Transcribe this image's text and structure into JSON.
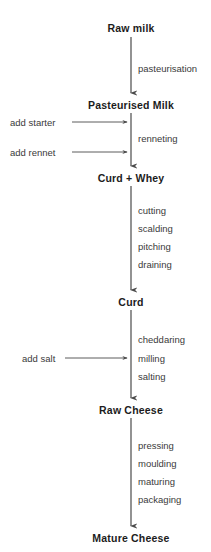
{
  "diagram": {
    "type": "vertical-flowchart",
    "colors": {
      "background": "#ffffff",
      "node_text": "#1c1c1c",
      "step_text": "#3a3a3a",
      "arrow": "#4a4a4a"
    },
    "axis_x": 131,
    "nodes": [
      {
        "id": "raw-milk",
        "label": "Raw milk",
        "x": 131,
        "y": 28
      },
      {
        "id": "pasteurised-milk",
        "label": "Pasteurised Milk",
        "x": 131,
        "y": 105
      },
      {
        "id": "curd-whey",
        "label": "Curd + Whey",
        "x": 131,
        "y": 178
      },
      {
        "id": "curd",
        "label": "Curd",
        "x": 131,
        "y": 302
      },
      {
        "id": "raw-cheese",
        "label": "Raw Cheese",
        "x": 131,
        "y": 410
      },
      {
        "id": "mature-cheese",
        "label": "Mature Cheese",
        "x": 131,
        "y": 538
      }
    ],
    "steps": [
      {
        "id": "pasteurisation",
        "label": "pasteurisation",
        "x": 138,
        "y": 68
      },
      {
        "id": "renneting",
        "label": "renneting",
        "x": 138,
        "y": 138
      },
      {
        "id": "cutting",
        "label": "cutting",
        "x": 138,
        "y": 210
      },
      {
        "id": "scalding",
        "label": "scalding",
        "x": 138,
        "y": 228
      },
      {
        "id": "pitching",
        "label": "pitching",
        "x": 138,
        "y": 246
      },
      {
        "id": "draining",
        "label": "draining",
        "x": 138,
        "y": 264
      },
      {
        "id": "cheddaring",
        "label": "cheddaring",
        "x": 138,
        "y": 339
      },
      {
        "id": "milling",
        "label": "milling",
        "x": 138,
        "y": 358
      },
      {
        "id": "salting",
        "label": "salting",
        "x": 138,
        "y": 376
      },
      {
        "id": "pressing",
        "label": "pressing",
        "x": 138,
        "y": 445
      },
      {
        "id": "moulding",
        "label": "moulding",
        "x": 138,
        "y": 463
      },
      {
        "id": "maturing",
        "label": "maturing",
        "x": 138,
        "y": 481
      },
      {
        "id": "packaging",
        "label": "packaging",
        "x": 138,
        "y": 499
      }
    ],
    "inputs": [
      {
        "id": "add-starter",
        "label": "add starter",
        "x": 10,
        "y": 122,
        "line_from": 72,
        "line_to": 128
      },
      {
        "id": "add-rennet",
        "label": "add rennet",
        "x": 10,
        "y": 152,
        "line_from": 72,
        "line_to": 128
      },
      {
        "id": "add-salt",
        "label": "add salt",
        "x": 22,
        "y": 358,
        "line_from": 65,
        "line_to": 128
      }
    ],
    "connectors": [
      {
        "id": "raw-milk-to-pasteurised",
        "x": 131,
        "y1": 37,
        "y2": 95
      },
      {
        "id": "pasteurised-to-curd-whey",
        "x": 131,
        "y1": 113,
        "y2": 168
      },
      {
        "id": "curd-whey-to-curd",
        "x": 131,
        "y1": 186,
        "y2": 292
      },
      {
        "id": "curd-to-raw-cheese",
        "x": 131,
        "y1": 310,
        "y2": 400
      },
      {
        "id": "raw-cheese-to-mature-cheese",
        "x": 131,
        "y1": 418,
        "y2": 528
      }
    ]
  }
}
